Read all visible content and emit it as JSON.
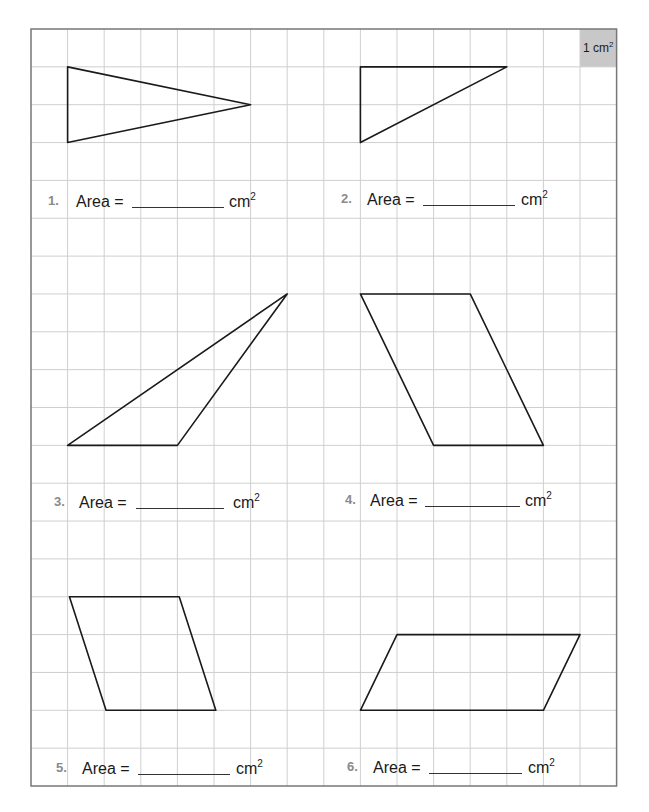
{
  "worksheet": {
    "grid": {
      "origin_x": 31,
      "origin_y": 29,
      "cell_width": 36.6,
      "cell_height": 37.85,
      "columns": 16,
      "rows": 20,
      "line_color": "#cfcfcf",
      "border_color": "#777777"
    },
    "unit_cell": {
      "col": 15,
      "row": 0,
      "fill": "#c8c8c8",
      "label": "1 cm",
      "exponent": "2"
    },
    "problems": [
      {
        "number": "1.",
        "label": "Area =",
        "answer": "",
        "unit": "cm",
        "exponent": "2",
        "shape": "triangle",
        "points": [
          [
            1,
            1
          ],
          [
            1,
            3
          ],
          [
            6,
            2
          ]
        ],
        "pos": {
          "y": 192,
          "num_x": 48,
          "word_x": 76,
          "blank_x": 132,
          "blank_w": 92,
          "unit_x": 229
        }
      },
      {
        "number": "2.",
        "label": "Area =",
        "answer": "",
        "unit": "cm",
        "exponent": "2",
        "shape": "triangle",
        "points": [
          [
            9,
            1
          ],
          [
            13,
            1
          ],
          [
            9,
            3
          ]
        ],
        "pos": {
          "y": 190,
          "num_x": 341,
          "word_x": 367,
          "blank_x": 423,
          "blank_w": 92,
          "unit_x": 521
        }
      },
      {
        "number": "3.",
        "label": "Area =",
        "answer": "",
        "unit": "cm",
        "exponent": "2",
        "shape": "triangle",
        "points": [
          [
            1,
            11
          ],
          [
            4,
            11
          ],
          [
            7,
            7
          ]
        ],
        "pos": {
          "y": 493,
          "num_x": 54,
          "word_x": 79,
          "blank_x": 136,
          "blank_w": 88,
          "unit_x": 233
        }
      },
      {
        "number": "4.",
        "label": "Area =",
        "answer": "",
        "unit": "cm",
        "exponent": "2",
        "shape": "parallelogram",
        "points": [
          [
            9,
            7
          ],
          [
            12,
            7
          ],
          [
            14,
            11
          ],
          [
            11,
            11
          ]
        ],
        "pos": {
          "y": 491,
          "num_x": 345,
          "word_x": 370,
          "blank_x": 425,
          "blank_w": 95,
          "unit_x": 525
        }
      },
      {
        "number": "5.",
        "label": "Area =",
        "answer": "",
        "unit": "cm",
        "exponent": "2",
        "shape": "parallelogram",
        "points": [
          [
            1.05,
            15
          ],
          [
            4.05,
            15
          ],
          [
            5.05,
            18
          ],
          [
            2.05,
            18
          ]
        ],
        "pos": {
          "y": 759,
          "num_x": 56,
          "word_x": 82,
          "blank_x": 138,
          "blank_w": 92,
          "unit_x": 236
        }
      },
      {
        "number": "6.",
        "label": "Area =",
        "answer": "",
        "unit": "cm",
        "exponent": "2",
        "shape": "parallelogram",
        "points": [
          [
            10,
            16
          ],
          [
            15,
            16
          ],
          [
            14,
            18
          ],
          [
            9,
            18
          ]
        ],
        "pos": {
          "y": 758,
          "num_x": 347,
          "word_x": 373,
          "blank_x": 429,
          "blank_w": 93,
          "unit_x": 528
        }
      }
    ]
  }
}
